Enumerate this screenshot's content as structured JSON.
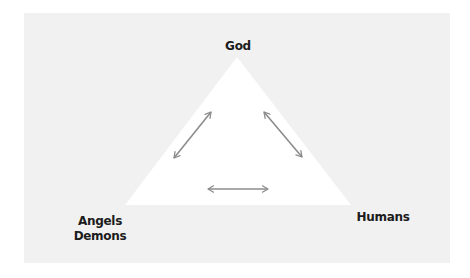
{
  "diagram": {
    "type": "triangle-relationship",
    "nodes": {
      "top": {
        "label": "God"
      },
      "bottom_left": {
        "lines": [
          "Angels",
          "Demons"
        ]
      },
      "bottom_right": {
        "label": "Humans"
      }
    },
    "edges": [
      {
        "from": "God",
        "to": "Angels/Demons",
        "style": "double-arrow"
      },
      {
        "from": "God",
        "to": "Humans",
        "style": "double-arrow"
      },
      {
        "from": "Angels/Demons",
        "to": "Humans",
        "style": "double-arrow"
      }
    ],
    "colors": {
      "panel": "#f1f1f1",
      "triangle": "#ffffff",
      "arrow": "#8c8c8c",
      "text": "#1c1c1c"
    }
  }
}
